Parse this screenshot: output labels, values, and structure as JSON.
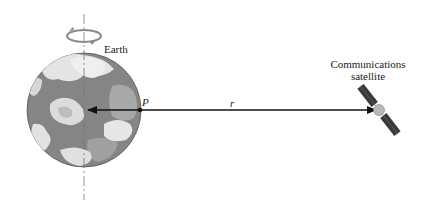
{
  "diagram": {
    "earth_label": "Earth",
    "point_label": "P",
    "distance_label": "r",
    "satellite_label_line1": "Communications",
    "satellite_label_line2": "satellite"
  },
  "colors": {
    "earth_dark": "#7a7a7a",
    "earth_mid": "#9a9a9a",
    "clouds": "#e6e6e6",
    "arrow": "#111111",
    "rotation_arrow": "#8a8a8a"
  }
}
